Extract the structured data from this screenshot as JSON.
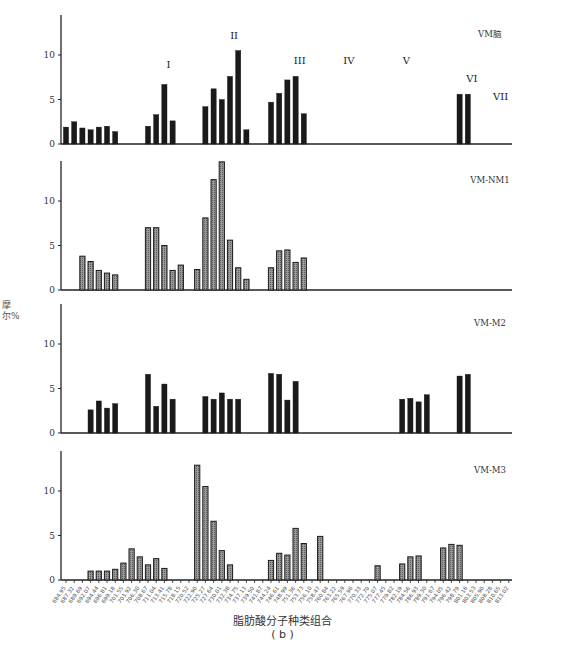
{
  "figure_label": "( b )",
  "xlabel": "脂肪酸分子种类组合",
  "ylabel": "摩尔%",
  "chart_data": {
    "type": "bar",
    "title": "",
    "xlabel": "脂肪酸分子种类组合",
    "ylabel": "摩尔%",
    "ylim": [
      0,
      14.5
    ],
    "yticks": [
      0,
      5,
      10
    ],
    "grid": false,
    "legend_position": "none",
    "slot_count": 55,
    "xtick_labels_first_last": [
      "684.95",
      "813.02"
    ],
    "group_labels": [
      {
        "label": "I",
        "slot": 12.5,
        "value": 8.5
      },
      {
        "label": "II",
        "slot": 20.5,
        "value": 11.8
      },
      {
        "label": "III",
        "slot": 28.5,
        "value": 9.0
      },
      {
        "label": "IV",
        "slot": 34.5,
        "value": 9.0
      },
      {
        "label": "V",
        "slot": 41.5,
        "value": 9.0
      },
      {
        "label": "VI",
        "slot": 49.5,
        "value": 7.0
      },
      {
        "label": "VII",
        "slot": 53.0,
        "value": 5.0
      }
    ],
    "panels": [
      {
        "name": "VM脑",
        "style": "solid",
        "bars": [
          {
            "slot": 0,
            "value": 1.9
          },
          {
            "slot": 1,
            "value": 2.5
          },
          {
            "slot": 2,
            "value": 1.8
          },
          {
            "slot": 3,
            "value": 1.6
          },
          {
            "slot": 4,
            "value": 1.9
          },
          {
            "slot": 5,
            "value": 2.0
          },
          {
            "slot": 6,
            "value": 1.4
          },
          {
            "slot": 10,
            "value": 2.0
          },
          {
            "slot": 11,
            "value": 3.3
          },
          {
            "slot": 12,
            "value": 6.7
          },
          {
            "slot": 13,
            "value": 2.6
          },
          {
            "slot": 17,
            "value": 4.2
          },
          {
            "slot": 18,
            "value": 6.2
          },
          {
            "slot": 19,
            "value": 5.0
          },
          {
            "slot": 20,
            "value": 7.6
          },
          {
            "slot": 21,
            "value": 10.5
          },
          {
            "slot": 22,
            "value": 1.6
          },
          {
            "slot": 25,
            "value": 4.7
          },
          {
            "slot": 26,
            "value": 5.7
          },
          {
            "slot": 27,
            "value": 7.2
          },
          {
            "slot": 28,
            "value": 7.6
          },
          {
            "slot": 29,
            "value": 3.4
          },
          {
            "slot": 48,
            "value": 5.6
          },
          {
            "slot": 49,
            "value": 5.6
          }
        ]
      },
      {
        "name": "VM-NM1",
        "style": "hatched",
        "bars": [
          {
            "slot": 2,
            "value": 3.8
          },
          {
            "slot": 3,
            "value": 3.2
          },
          {
            "slot": 4,
            "value": 2.2
          },
          {
            "slot": 5,
            "value": 1.9
          },
          {
            "slot": 6,
            "value": 1.7
          },
          {
            "slot": 10,
            "value": 7.0
          },
          {
            "slot": 11,
            "value": 7.0
          },
          {
            "slot": 12,
            "value": 5.0
          },
          {
            "slot": 13,
            "value": 2.2
          },
          {
            "slot": 14,
            "value": 2.8
          },
          {
            "slot": 16,
            "value": 2.3
          },
          {
            "slot": 17,
            "value": 8.1
          },
          {
            "slot": 18,
            "value": 12.4
          },
          {
            "slot": 19,
            "value": 14.4
          },
          {
            "slot": 20,
            "value": 5.6
          },
          {
            "slot": 21,
            "value": 2.5
          },
          {
            "slot": 22,
            "value": 1.2
          },
          {
            "slot": 25,
            "value": 2.5
          },
          {
            "slot": 26,
            "value": 4.4
          },
          {
            "slot": 27,
            "value": 4.5
          },
          {
            "slot": 28,
            "value": 3.1
          },
          {
            "slot": 29,
            "value": 3.6
          }
        ]
      },
      {
        "name": "VM-M2",
        "style": "solid",
        "bars": [
          {
            "slot": 3,
            "value": 2.6
          },
          {
            "slot": 4,
            "value": 3.6
          },
          {
            "slot": 5,
            "value": 2.8
          },
          {
            "slot": 6,
            "value": 3.3
          },
          {
            "slot": 10,
            "value": 6.6
          },
          {
            "slot": 11,
            "value": 3.0
          },
          {
            "slot": 12,
            "value": 5.5
          },
          {
            "slot": 13,
            "value": 3.8
          },
          {
            "slot": 17,
            "value": 4.1
          },
          {
            "slot": 18,
            "value": 3.8
          },
          {
            "slot": 19,
            "value": 4.5
          },
          {
            "slot": 20,
            "value": 3.8
          },
          {
            "slot": 21,
            "value": 3.8
          },
          {
            "slot": 25,
            "value": 6.7
          },
          {
            "slot": 26,
            "value": 6.6
          },
          {
            "slot": 27,
            "value": 3.7
          },
          {
            "slot": 28,
            "value": 5.8
          },
          {
            "slot": 41,
            "value": 3.8
          },
          {
            "slot": 42,
            "value": 3.9
          },
          {
            "slot": 43,
            "value": 3.5
          },
          {
            "slot": 44,
            "value": 4.3
          },
          {
            "slot": 48,
            "value": 6.4
          },
          {
            "slot": 49,
            "value": 6.6
          }
        ]
      },
      {
        "name": "VM-M3",
        "style": "hatched",
        "bars": [
          {
            "slot": 3,
            "value": 1.0
          },
          {
            "slot": 4,
            "value": 1.0
          },
          {
            "slot": 5,
            "value": 1.0
          },
          {
            "slot": 6,
            "value": 1.2
          },
          {
            "slot": 7,
            "value": 1.9
          },
          {
            "slot": 8,
            "value": 3.5
          },
          {
            "slot": 9,
            "value": 2.6
          },
          {
            "slot": 10,
            "value": 1.7
          },
          {
            "slot": 11,
            "value": 2.4
          },
          {
            "slot": 12,
            "value": 1.3
          },
          {
            "slot": 16,
            "value": 12.9
          },
          {
            "slot": 17,
            "value": 10.5
          },
          {
            "slot": 18,
            "value": 6.6
          },
          {
            "slot": 19,
            "value": 3.3
          },
          {
            "slot": 20,
            "value": 1.7
          },
          {
            "slot": 25,
            "value": 2.2
          },
          {
            "slot": 26,
            "value": 3.0
          },
          {
            "slot": 27,
            "value": 2.8
          },
          {
            "slot": 28,
            "value": 5.8
          },
          {
            "slot": 29,
            "value": 4.1
          },
          {
            "slot": 31,
            "value": 4.9
          },
          {
            "slot": 38,
            "value": 1.6
          },
          {
            "slot": 41,
            "value": 1.8
          },
          {
            "slot": 42,
            "value": 2.6
          },
          {
            "slot": 43,
            "value": 2.7
          },
          {
            "slot": 46,
            "value": 3.6
          },
          {
            "slot": 47,
            "value": 4.0
          },
          {
            "slot": 48,
            "value": 3.9
          }
        ]
      }
    ]
  }
}
